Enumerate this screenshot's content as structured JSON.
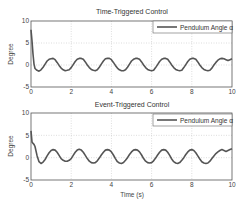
{
  "chart_data": [
    {
      "type": "line",
      "title": "Time-Triggered Control",
      "xlabel": "",
      "ylabel": "Degree",
      "xlim": [
        0,
        10
      ],
      "ylim": [
        -5,
        10
      ],
      "xticks": [
        "0",
        "2",
        "4",
        "6",
        "8",
        "10"
      ],
      "yticks": [
        "-5",
        "0",
        "5",
        "10"
      ],
      "grid": true,
      "legend_position": "upper right",
      "series": [
        {
          "name": "Pendulum Angle α",
          "color": "#555555",
          "x": [
            0,
            0.05,
            0.1,
            0.15,
            0.2,
            0.3,
            0.4,
            0.5,
            0.6,
            0.7,
            0.8,
            0.9,
            1.0,
            1.1,
            1.2,
            1.3,
            1.4,
            1.5,
            1.6,
            1.7,
            1.8,
            1.9,
            2.0,
            2.1,
            2.2,
            2.3,
            2.4,
            2.5,
            2.6,
            2.7,
            2.8,
            2.9,
            3.0,
            3.1,
            3.2,
            3.3,
            3.4,
            3.5,
            3.6,
            3.7,
            3.8,
            3.9,
            4.0,
            4.1,
            4.2,
            4.3,
            4.4,
            4.5,
            4.6,
            4.7,
            4.8,
            4.9,
            5.0,
            5.1,
            5.2,
            5.3,
            5.4,
            5.5,
            5.6,
            5.7,
            5.8,
            5.9,
            6.0,
            6.1,
            6.2,
            6.3,
            6.4,
            6.5,
            6.6,
            6.7,
            6.8,
            6.9,
            7.0,
            7.1,
            7.2,
            7.3,
            7.4,
            7.5,
            7.6,
            7.7,
            7.8,
            7.9,
            8.0,
            8.1,
            8.2,
            8.3,
            8.4,
            8.5,
            8.6,
            8.7,
            8.8,
            8.9,
            9.0,
            9.1,
            9.2,
            9.3,
            9.4,
            9.5,
            9.6,
            9.7,
            9.8,
            9.9,
            10.0
          ],
          "y": [
            8.0,
            5.5,
            2.5,
            0.2,
            -0.8,
            -1.2,
            -1.4,
            -1.1,
            -0.5,
            0.2,
            0.9,
            1.3,
            1.4,
            1.5,
            1.2,
            0.6,
            -0.1,
            -0.7,
            -1.1,
            -1.3,
            -1.2,
            -1.1,
            -0.6,
            0.1,
            0.8,
            1.3,
            1.5,
            1.5,
            1.3,
            0.7,
            0.0,
            -0.6,
            -1.0,
            -1.2,
            -1.3,
            -1.1,
            -0.5,
            0.2,
            0.9,
            1.4,
            1.5,
            1.5,
            1.2,
            0.6,
            -0.1,
            -0.7,
            -1.1,
            -1.3,
            -1.3,
            -1.1,
            -0.5,
            0.2,
            0.9,
            1.3,
            1.5,
            1.5,
            1.3,
            0.7,
            0.0,
            -0.6,
            -1.0,
            -1.2,
            -1.3,
            -1.2,
            -0.6,
            0.1,
            0.8,
            1.3,
            1.5,
            1.5,
            1.3,
            0.7,
            0.0,
            -0.6,
            -1.0,
            -1.2,
            -1.3,
            -1.2,
            -0.6,
            0.1,
            0.8,
            1.3,
            1.5,
            1.5,
            1.3,
            0.7,
            0.0,
            -0.6,
            -1.0,
            -1.2,
            -1.3,
            -1.2,
            -0.7,
            0.0,
            0.6,
            1.1,
            1.4,
            1.5,
            1.4,
            1.2,
            1.0,
            1.2,
            1.4
          ]
        }
      ]
    },
    {
      "type": "line",
      "title": "Event-Triggered Control",
      "xlabel": "Time (s)",
      "ylabel": "Degree",
      "xlim": [
        0,
        10
      ],
      "ylim": [
        -5,
        10
      ],
      "xticks": [
        "0",
        "2",
        "4",
        "6",
        "8",
        "10"
      ],
      "yticks": [
        "-5",
        "0",
        "5",
        "10"
      ],
      "grid": true,
      "legend_position": "upper right",
      "series": [
        {
          "name": "Pendulum Angle α",
          "color": "#555555",
          "x": [
            0,
            0.05,
            0.1,
            0.15,
            0.2,
            0.3,
            0.4,
            0.5,
            0.6,
            0.7,
            0.8,
            0.9,
            1.0,
            1.1,
            1.2,
            1.3,
            1.4,
            1.5,
            1.6,
            1.7,
            1.8,
            1.9,
            2.0,
            2.1,
            2.2,
            2.3,
            2.4,
            2.5,
            2.6,
            2.7,
            2.8,
            2.9,
            3.0,
            3.1,
            3.2,
            3.3,
            3.4,
            3.5,
            3.6,
            3.7,
            3.8,
            3.9,
            4.0,
            4.1,
            4.2,
            4.3,
            4.4,
            4.5,
            4.6,
            4.7,
            4.8,
            4.9,
            5.0,
            5.1,
            5.2,
            5.3,
            5.4,
            5.5,
            5.6,
            5.7,
            5.8,
            5.9,
            6.0,
            6.1,
            6.2,
            6.3,
            6.4,
            6.5,
            6.6,
            6.7,
            6.8,
            6.9,
            7.0,
            7.1,
            7.2,
            7.3,
            7.4,
            7.5,
            7.6,
            7.7,
            7.8,
            7.9,
            8.0,
            8.1,
            8.2,
            8.3,
            8.4,
            8.5,
            8.6,
            8.7,
            8.8,
            8.9,
            9.0,
            9.1,
            9.2,
            9.3,
            9.4,
            9.5,
            9.6,
            9.7,
            9.8,
            9.9,
            10.0
          ],
          "y": [
            6.0,
            3.5,
            3.2,
            3.0,
            2.5,
            0.5,
            -0.9,
            -1.3,
            -1.0,
            -0.4,
            0.4,
            1.1,
            1.6,
            1.8,
            1.7,
            1.2,
            0.5,
            -0.2,
            -0.6,
            -0.8,
            -0.8,
            -0.6,
            -0.2,
            0.5,
            1.2,
            1.7,
            1.9,
            1.7,
            1.2,
            0.5,
            -0.2,
            -0.8,
            -1.1,
            -1.2,
            -1.1,
            -0.7,
            -0.1,
            0.6,
            1.2,
            1.7,
            1.8,
            1.7,
            1.3,
            0.6,
            -0.2,
            -0.9,
            -1.2,
            -1.3,
            -1.1,
            -0.6,
            0.0,
            0.7,
            1.3,
            1.7,
            1.8,
            1.7,
            1.3,
            0.6,
            -0.2,
            -0.8,
            -1.1,
            -1.2,
            -1.1,
            -0.7,
            -0.1,
            0.6,
            1.2,
            1.7,
            1.8,
            1.7,
            1.2,
            0.5,
            -0.3,
            -0.9,
            -1.2,
            -1.3,
            -1.1,
            -0.6,
            0.0,
            0.7,
            1.3,
            1.7,
            1.8,
            1.6,
            1.1,
            0.4,
            -0.3,
            -0.9,
            -1.2,
            -1.3,
            -1.2,
            -0.8,
            -0.2,
            0.4,
            0.9,
            1.3,
            1.6,
            1.8,
            1.6,
            1.4,
            1.6,
            1.8,
            2.0
          ]
        }
      ]
    }
  ],
  "plots": [
    {
      "title": "Time-Triggered Control",
      "ylabel": "Degree",
      "xlabel": "",
      "legend": "Pendulum Angle α"
    },
    {
      "title": "Event-Triggered Control",
      "ylabel": "Degree",
      "xlabel": "Time (s)",
      "legend": "Pendulum Angle α"
    }
  ]
}
